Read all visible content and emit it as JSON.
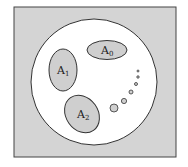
{
  "diagram": {
    "frame": {
      "fill": "#d4d4d4",
      "stroke": "#444444"
    },
    "universe": {
      "fill": "#ffffff",
      "stroke": "#333333"
    },
    "sets": [
      {
        "id": "A0",
        "base": "A",
        "subscript": "0",
        "fill": "#cfcfcf"
      },
      {
        "id": "A1",
        "base": "A",
        "subscript": "1",
        "fill": "#cfcfcf"
      },
      {
        "id": "A2",
        "base": "A",
        "subscript": "2",
        "fill": "#cfcfcf"
      }
    ],
    "continuation": {
      "description": "sequence of shrinking circles indicating further sets",
      "count": 6
    }
  }
}
